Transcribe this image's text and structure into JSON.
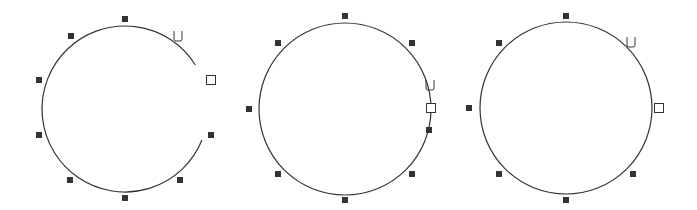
{
  "diagram": {
    "colors": {
      "stroke": "#333333",
      "background": "#ffffff",
      "endpoint_fill": "#ffffff"
    },
    "figures": [
      {
        "id": "open-arc",
        "state": "open path with gap on right side",
        "center": [
          125,
          109
        ],
        "radius": 83,
        "arc_start_deg": -32,
        "arc_end_deg": 22,
        "handles": [
          [
            125,
            19
          ],
          [
            71,
            36
          ],
          [
            39,
            80
          ],
          [
            39,
            135
          ],
          [
            70,
            180
          ],
          [
            125,
            198
          ],
          [
            180,
            180
          ],
          [
            211,
            135
          ]
        ],
        "endpoint": [
          211,
          80
        ],
        "cursor": {
          "glyph": "U",
          "pos": [
            178,
            36
          ]
        }
      },
      {
        "id": "closing-arc",
        "state": "path about to close, endpoint overlapping handle",
        "center": [
          345,
          109
        ],
        "radius": 86,
        "arc_start_deg": 0,
        "arc_end_deg": 0,
        "handles": [
          [
            345,
            16
          ],
          [
            278,
            43
          ],
          [
            249,
            109
          ],
          [
            278,
            174
          ],
          [
            345,
            200
          ],
          [
            412,
            174
          ],
          [
            429,
            130
          ],
          [
            412,
            43
          ],
          [
            430,
            108
          ]
        ],
        "endpoint": [
          431,
          108
        ],
        "cursor": {
          "glyph": "U",
          "pos": [
            430,
            85
          ]
        }
      },
      {
        "id": "closed-circle",
        "state": "closed circle",
        "center": [
          566,
          108
        ],
        "radius": 86,
        "arc_start_deg": 0,
        "arc_end_deg": 0,
        "handles": [
          [
            566,
            16
          ],
          [
            499,
            43
          ],
          [
            469,
            108
          ],
          [
            499,
            174
          ],
          [
            566,
            200
          ],
          [
            633,
            174
          ]
        ],
        "endpoint": [
          659,
          108
        ],
        "cursor": {
          "glyph": "U",
          "pos": [
            631,
            42
          ]
        }
      }
    ]
  }
}
